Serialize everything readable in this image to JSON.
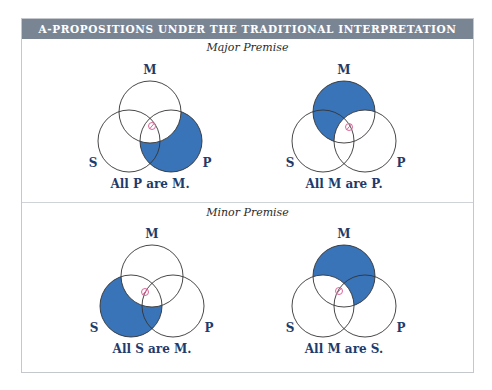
{
  "header": {
    "title": "A-PROPOSITIONS UNDER THE TRADITIONAL INTERPRETATION"
  },
  "sections": [
    {
      "subtitle": "Major Premise"
    },
    {
      "subtitle": "Minor Premise"
    }
  ],
  "diagrams": [
    {
      "caption": "All P are M.",
      "labels": {
        "m": "M",
        "s": "S",
        "p": "P"
      },
      "shaded_region": "P outside M"
    },
    {
      "caption": "All M are P.",
      "labels": {
        "m": "M",
        "s": "S",
        "p": "P"
      },
      "shaded_region": "M outside P"
    },
    {
      "caption": "All S are M.",
      "labels": {
        "m": "M",
        "s": "S",
        "p": "P"
      },
      "shaded_region": "S outside M"
    },
    {
      "caption": "All M are S.",
      "labels": {
        "m": "M",
        "s": "S",
        "p": "P"
      },
      "shaded_region": "M outside S"
    }
  ],
  "colors": {
    "header_bg": "#7a8594",
    "shade": "#3a74b8",
    "label": "#1f3b6b",
    "existence_mark": "#d9669a"
  },
  "marks": {
    "existence_mark_icon": "slashed-circle"
  }
}
